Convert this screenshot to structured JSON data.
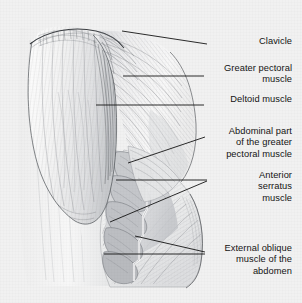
{
  "figure": {
    "kind": "anatomical-illustration",
    "style": "pencil and ink medical illustration, grayscale",
    "background_color": "#f1f1f1",
    "ink_color": "#141414",
    "shading_color": "#8f9296"
  },
  "labels": [
    {
      "id": "clavicle",
      "text": "Clavicle",
      "x": 292,
      "y": 41,
      "lines": 1
    },
    {
      "id": "greater-pectoral-muscle",
      "text": "Greater pectoral\nmuscle",
      "x": 292,
      "y": 68,
      "lines": 2
    },
    {
      "id": "deltoid-muscle",
      "text": "Deltoid muscle",
      "x": 292,
      "y": 99,
      "lines": 1
    },
    {
      "id": "abdominal-part-of-greater-pectoral-muscle",
      "text": "Abdominal part\nof the greater\npectoral muscle",
      "x": 292,
      "y": 131,
      "lines": 3
    },
    {
      "id": "anterior-serratus-muscle",
      "text": "Anterior\nserratus\nmuscle",
      "x": 292,
      "y": 175,
      "lines": 3
    },
    {
      "id": "external-oblique-muscle-of-the-abdomen",
      "text": "External oblique\nmuscle of the\nabdomen",
      "x": 292,
      "y": 248,
      "lines": 3
    }
  ],
  "leader_lines": [
    {
      "id": "leader-clavicle",
      "points": "122,31 207,44"
    },
    {
      "id": "leader-greater-pectoral",
      "points": "123,76 204,76"
    },
    {
      "id": "leader-deltoid",
      "points": "96,105 204,105"
    },
    {
      "id": "leader-abdominal-part",
      "points": "128,163 205,137"
    },
    {
      "id": "leader-serratus-upper",
      "points": "116,180 207,180"
    },
    {
      "id": "leader-serratus-lower",
      "points": "110,222 207,181"
    },
    {
      "id": "leader-external-oblique-upper",
      "points": "135,236 205,252"
    },
    {
      "id": "leader-external-oblique-lower",
      "points": "104,254 205,254"
    }
  ],
  "anatomy_regions": [
    {
      "id": "deltoid",
      "description": "large rounded muscle mass of the shoulder, vertical striations"
    },
    {
      "id": "greater-pectoral",
      "description": "fan-shaped chest muscle with fibres radiating to the humerus"
    },
    {
      "id": "abdominal-part-of-greater-pectoral",
      "description": "lower oblique slip of the pectoralis major"
    },
    {
      "id": "serratus-anterior",
      "description": "series of finger-like digitations along the rib cage"
    },
    {
      "id": "external-oblique",
      "description": "broad sheet of the lateral abdominal wall, oblique fibres"
    },
    {
      "id": "clavicle",
      "description": "collar bone forming the upper border of the shoulder"
    }
  ]
}
